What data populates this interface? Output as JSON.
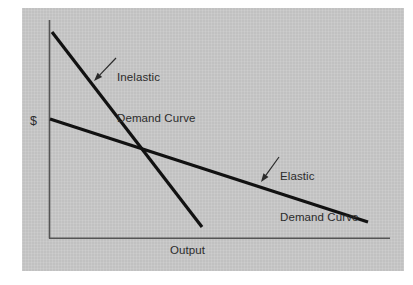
{
  "figure": {
    "name": "elasticity-demand-curves",
    "background_color": "#ffffff",
    "panel_color": "#c9c9c9",
    "line_color": "#111111",
    "axis_color": "#555555",
    "text_color": "#2b2b2b"
  },
  "axes": {
    "y_axis_label": "$",
    "x_axis_label": "Output"
  },
  "annotations": {
    "inelastic": {
      "line1": "Inelastic",
      "line2": "Demand Curve"
    },
    "elastic": {
      "line1": "Elastic",
      "line2": "Demand Curve"
    }
  },
  "chart_data": {
    "type": "line",
    "title": "",
    "xlabel": "Output",
    "ylabel": "$",
    "grid": false,
    "legend_position": "inline-annotations",
    "axis_ranges": {
      "x": [
        0,
        1
      ],
      "y": [
        0,
        1
      ]
    },
    "axis_style": {
      "x_axis_only_bottom": true,
      "y_axis_only_left": true,
      "ticks": false,
      "tick_labels": false
    },
    "series": [
      {
        "name": "Inelastic Demand Curve",
        "description": "Steeply sloping downward demand curve",
        "points_px": [
          [
            52,
            32
          ],
          [
            202,
            227
          ]
        ],
        "points_normalized": [
          [
            0.009,
            0.945
          ],
          [
            0.449,
            0.05
          ]
        ],
        "slope_sign": "negative",
        "relative_steepness": "steep",
        "stroke_width_px": 3.2
      },
      {
        "name": "Elastic Demand Curve",
        "description": "Gently sloping downward demand curve",
        "points_px": [
          [
            50,
            119
          ],
          [
            368,
            222
          ]
        ],
        "points_normalized": [
          [
            0.003,
            0.546
          ],
          [
            0.936,
            0.073
          ]
        ],
        "slope_sign": "negative",
        "relative_steepness": "shallow",
        "stroke_width_px": 3.2
      }
    ],
    "intersection_px": [
      143,
      147
    ],
    "intersection_normalized": [
      0.276,
      0.418
    ],
    "annotation_arrows": [
      {
        "label": "Inelastic Demand Curve",
        "from_px": [
          116,
          58
        ],
        "to_px": [
          94,
          81
        ]
      },
      {
        "label": "Elastic Demand Curve",
        "from_px": [
          279,
          157
        ],
        "to_px": [
          261,
          182
        ]
      }
    ]
  }
}
